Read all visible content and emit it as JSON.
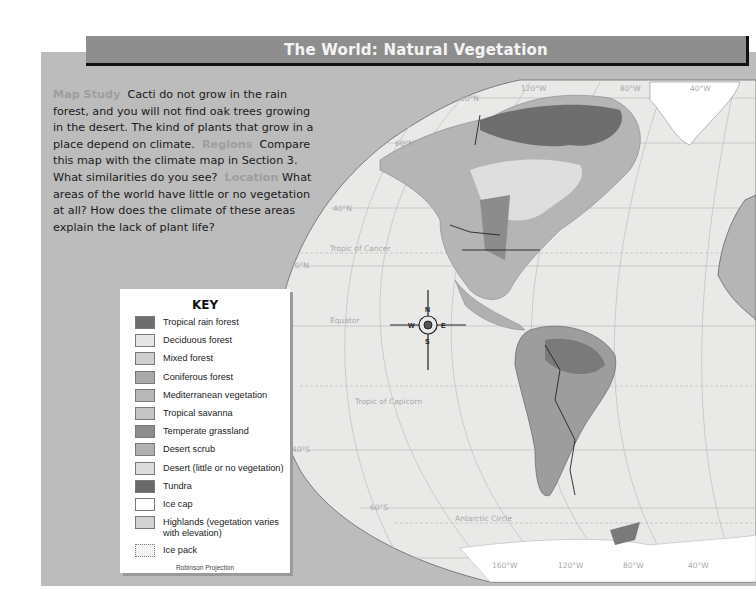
{
  "header": {
    "title": "The World: Natural Vegetation"
  },
  "intro": {
    "map_study_label": "Map Study",
    "map_study_text": "Cacti do not grow in the rain forest, and you will not find oak trees growing in the desert. The kind of plants that grow in a place depend on climate.",
    "regions_label": "Regions",
    "regions_text": "Compare this map with the climate map in Section 3. What similarities do you see?",
    "location_label": "Location",
    "location_text": "What areas of the world have little or no vegetation at all? How does the climate of these areas explain the lack of plant life?"
  },
  "key": {
    "title": "KEY",
    "items": [
      {
        "label": "Tropical rain forest",
        "color": "#6e6e6e"
      },
      {
        "label": "Deciduous forest",
        "color": "#e6e6e6"
      },
      {
        "label": "Mixed forest",
        "color": "#cfcfcf"
      },
      {
        "label": "Coniferous forest",
        "color": "#a9a9a9"
      },
      {
        "label": "Mediterranean vegetation",
        "color": "#b8b8b8"
      },
      {
        "label": "Tropical savanna",
        "color": "#c6c6c6"
      },
      {
        "label": "Temperate grassland",
        "color": "#8c8c8c"
      },
      {
        "label": "Desert scrub",
        "color": "#b0b0b0"
      },
      {
        "label": "Desert (little or no vegetation)",
        "color": "#dcdcdc"
      },
      {
        "label": "Tundra",
        "color": "#6a6a6a"
      },
      {
        "label": "Ice cap",
        "color": "#ffffff"
      },
      {
        "label": "Highlands (vegetation varies with elevation)",
        "color": "#d2d2d2"
      },
      {
        "label": "Ice pack",
        "color": "#f2f2f2"
      }
    ],
    "projection": "Robinson Projection"
  },
  "map": {
    "latitudes": [
      "80°N",
      "60°N",
      "40°N",
      "20°N",
      "40°S",
      "60°S"
    ],
    "longitudes_top": [
      "120°W",
      "80°W",
      "40°W"
    ],
    "longitudes_bottom": [
      "160°W",
      "120°W",
      "80°W",
      "40°W"
    ],
    "special_lines": [
      "Tropic of Cancer",
      "Equator",
      "Tropic of Capricorn",
      "Antarctic Circle"
    ],
    "compass": {
      "n": "N",
      "s": "S",
      "e": "E",
      "w": "W"
    }
  }
}
